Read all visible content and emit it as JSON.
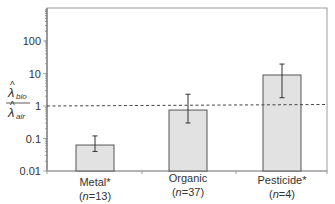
{
  "chart_data": {
    "type": "bar",
    "title": "",
    "xlabel": "",
    "ylabel": "λ̂bio / λ̂air",
    "ylabel_numerator": "bio",
    "ylabel_denominator": "air",
    "yscale": "log",
    "ylim": [
      0.01,
      1000
    ],
    "yticks": [
      0.01,
      0.1,
      1,
      10,
      100
    ],
    "ytick_labels": [
      "0.01",
      "0.1",
      "1",
      "10",
      "100"
    ],
    "grid": false,
    "legend": null,
    "reference_line": {
      "y": 1,
      "style": "dashed"
    },
    "categories": [
      "Metal*",
      "Organic",
      "Pesticide*"
    ],
    "category_n": [
      "(n=13)",
      "(n=37)",
      "(n=4)"
    ],
    "n_values": [
      13,
      37,
      4
    ],
    "values": [
      0.063,
      0.75,
      9.0
    ],
    "error_low": [
      0.04,
      0.3,
      1.8
    ],
    "error_high": [
      0.12,
      2.3,
      19.5
    ]
  },
  "labels": {
    "cat0": "Metal*",
    "cat1": "Organic",
    "cat2": "Pesticide*",
    "n0": "13",
    "n1": "37",
    "n2": "4",
    "n_prefix": "n",
    "y0": "0.01",
    "y1": "0.1",
    "y2": "1",
    "y3": "10",
    "y4": "100",
    "ylab_sym": "λ",
    "ylab_num_sub": "bio",
    "ylab_den_sub": "air"
  },
  "colors": {
    "bar_fill": "#e2e2e2",
    "bar_stroke": "#555555",
    "axis": "#888888",
    "dashed_line": "#444444",
    "error_bar": "#333333"
  }
}
